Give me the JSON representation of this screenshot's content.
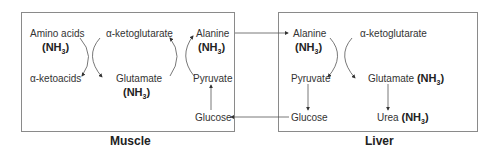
{
  "muscle": {
    "label": "Muscle",
    "amino_acids": "Amino acids",
    "amino_nh3": "NH",
    "alpha_ketoacids": "α-ketoacids",
    "alpha_ketoglutarate": "α-ketoglutarate",
    "glutamate": "Glutamate",
    "glutamate_nh3": "NH",
    "alanine": "Alanine",
    "alanine_nh3": "NH",
    "pyruvate": "Pyruvate",
    "glucose": "Glucose"
  },
  "liver": {
    "label": "Liver",
    "alanine": "Alanine",
    "alanine_nh3": "NH",
    "alpha_ketoglutarate": "α-ketoglutarate",
    "pyruvate": "Pyruvate",
    "glutamate": "Glutamate",
    "glutamate_nh3": "NH",
    "glucose": "Glucose",
    "urea": "Urea",
    "urea_nh3": "NH"
  },
  "subscript": "3"
}
